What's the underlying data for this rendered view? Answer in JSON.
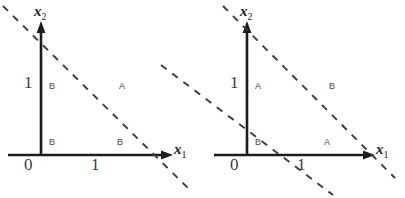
{
  "figure": {
    "type": "diagram",
    "background_color": "#ffffff",
    "axis_color": "#1c1c1c",
    "dash_color": "#3c3c3c",
    "text_color": "#3a3a3a"
  },
  "panels": [
    {
      "id": "left",
      "axes": {
        "x_label": "x",
        "x_subscript": "1",
        "y_label": "x",
        "y_subscript": "2",
        "origin_label": "0",
        "x_tick_label": "1",
        "y_tick_label": "1"
      },
      "dashed_lines": [
        {
          "name": "constraint-line-1",
          "intercept": 1,
          "slope": -1
        }
      ],
      "regions": [
        {
          "name": "region-upper-left",
          "label": "B"
        },
        {
          "name": "region-upper-right",
          "label": "A"
        },
        {
          "name": "region-lower-left",
          "label": "B"
        },
        {
          "name": "region-lower-right",
          "label": "B"
        }
      ]
    },
    {
      "id": "right",
      "axes": {
        "x_label": "x",
        "x_subscript": "1",
        "y_label": "x",
        "y_subscript": "2",
        "origin_label": "0",
        "x_tick_label": "1",
        "y_tick_label": "1"
      },
      "dashed_lines": [
        {
          "name": "constraint-line-1",
          "intercept": 1.9,
          "slope": -1
        },
        {
          "name": "constraint-line-2",
          "intercept": 0.55,
          "slope": -1
        }
      ],
      "regions": [
        {
          "name": "region-upper-left",
          "label": "A"
        },
        {
          "name": "region-upper-right",
          "label": "B"
        },
        {
          "name": "region-lower-left",
          "label": "B"
        },
        {
          "name": "region-lower-right",
          "label": "A"
        }
      ]
    }
  ]
}
